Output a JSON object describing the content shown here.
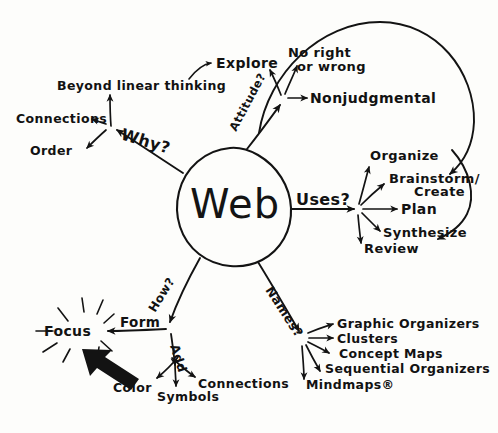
{
  "diagram": {
    "title_word": "Web",
    "type": "hand-drawn mind map",
    "central_node": {
      "label": "Web",
      "shape": "circle"
    },
    "branches": [
      {
        "id": "why",
        "question_label": "Why?",
        "direction": "upper-left",
        "children": [
          {
            "label": "Beyond linear thinking"
          },
          {
            "label": "Connections"
          },
          {
            "label": "Order"
          }
        ]
      },
      {
        "id": "attitude",
        "question_label": "Attitude?",
        "direction": "upper-right",
        "children": [
          {
            "label": "Explore"
          },
          {
            "label": "No right"
          },
          {
            "label": "or wrong"
          },
          {
            "label": "Nonjudgmental"
          }
        ]
      },
      {
        "id": "uses",
        "question_label": "Uses?",
        "direction": "right",
        "children": [
          {
            "label": "Organize"
          },
          {
            "label": "Brainstorm/"
          },
          {
            "label": "Create"
          },
          {
            "label": "Plan"
          },
          {
            "label": "Synthesize"
          },
          {
            "label": "Review"
          }
        ]
      },
      {
        "id": "names",
        "question_label": "Names?",
        "direction": "lower-right",
        "children": [
          {
            "label": "Graphic Organizers"
          },
          {
            "label": "Clusters"
          },
          {
            "label": "Concept Maps"
          },
          {
            "label": "Sequential Organizers"
          },
          {
            "label": "Mindmaps®"
          }
        ]
      },
      {
        "id": "how",
        "question_label": "How?",
        "direction": "lower-left",
        "children": [
          {
            "label": "Form"
          },
          {
            "label": "Focus"
          },
          {
            "label": "Add"
          },
          {
            "label": "Color"
          },
          {
            "label": "Symbols"
          },
          {
            "label": "Connections"
          }
        ]
      }
    ],
    "annotations": [
      {
        "name": "focus-starburst",
        "label": "radiating rays around Focus"
      },
      {
        "name": "bold-pointer-arrow",
        "label": "thick black arrow pointing at Focus"
      },
      {
        "name": "loop-arrow-top",
        "label": "long curved arrow from Attitude area to Brainstorm/Create"
      },
      {
        "name": "loop-arrow-right",
        "label": "curved arrow looping down to Synthesize"
      },
      {
        "name": "explore-curve-arrow",
        "label": "curved arrow pointing to Explore"
      }
    ],
    "colors": {
      "ink": "#131313",
      "paper": "#fdfdfb"
    }
  }
}
